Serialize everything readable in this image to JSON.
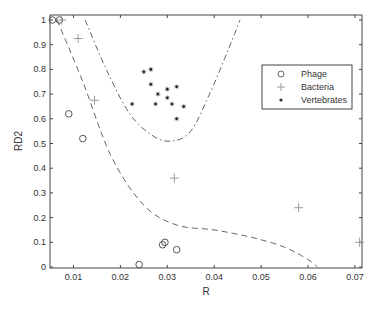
{
  "chart_data": {
    "type": "scatter",
    "title": "",
    "xlabel": "R",
    "ylabel": "RD2",
    "xlim": [
      0.005,
      0.0715
    ],
    "ylim": [
      0,
      1.0
    ],
    "xticks": [
      0.01,
      0.02,
      0.03,
      0.04,
      0.05,
      0.06,
      0.07
    ],
    "xtick_labels": [
      "0.01",
      "0.02",
      "0.03",
      "0.04",
      "0.05",
      "0.06",
      "0.07"
    ],
    "yticks": [
      0,
      0.1,
      0.2,
      0.3,
      0.4,
      0.5,
      0.6,
      0.7,
      0.8,
      0.9,
      1
    ],
    "ytick_labels": [
      "0",
      "0.1",
      "0.2",
      "0.3",
      "0.4",
      "0.5",
      "0.6",
      "0.7",
      "0.8",
      "0.9",
      "1"
    ],
    "grid": false,
    "legend_position": "upper right (inside)",
    "series": [
      {
        "name": "Phage",
        "marker": "circle",
        "points": [
          [
            0.0055,
            1.0
          ],
          [
            0.007,
            1.0
          ],
          [
            0.009,
            0.62
          ],
          [
            0.012,
            0.52
          ],
          [
            0.024,
            0.01
          ],
          [
            0.029,
            0.09
          ],
          [
            0.0295,
            0.1
          ],
          [
            0.032,
            0.07
          ]
        ]
      },
      {
        "name": "Bacteria",
        "marker": "plus",
        "points": [
          [
            0.0075,
            1.0
          ],
          [
            0.011,
            0.925
          ],
          [
            0.0145,
            0.675
          ],
          [
            0.0315,
            0.36
          ],
          [
            0.058,
            0.24
          ],
          [
            0.071,
            0.1
          ]
        ]
      },
      {
        "name": "Vertebrates",
        "marker": "star",
        "points": [
          [
            0.0225,
            0.66
          ],
          [
            0.025,
            0.79
          ],
          [
            0.0265,
            0.8
          ],
          [
            0.0265,
            0.74
          ],
          [
            0.0275,
            0.66
          ],
          [
            0.028,
            0.7
          ],
          [
            0.03,
            0.72
          ],
          [
            0.03,
            0.685
          ],
          [
            0.031,
            0.66
          ],
          [
            0.032,
            0.6
          ],
          [
            0.032,
            0.73
          ],
          [
            0.0335,
            0.65
          ]
        ]
      }
    ],
    "boundaries": [
      {
        "name": "lower-boundary",
        "style": "dashed",
        "points": [
          [
            0.0065,
            1.0
          ],
          [
            0.012,
            0.75
          ],
          [
            0.018,
            0.45
          ],
          [
            0.025,
            0.25
          ],
          [
            0.032,
            0.17
          ],
          [
            0.04,
            0.15
          ],
          [
            0.048,
            0.12
          ],
          [
            0.055,
            0.08
          ],
          [
            0.06,
            0.03
          ],
          [
            0.062,
            0.0
          ]
        ]
      },
      {
        "name": "upper-boundary",
        "style": "dash-dot",
        "points": [
          [
            0.0125,
            1.0
          ],
          [
            0.017,
            0.8
          ],
          [
            0.022,
            0.62
          ],
          [
            0.027,
            0.53
          ],
          [
            0.031,
            0.51
          ],
          [
            0.035,
            0.55
          ],
          [
            0.039,
            0.7
          ],
          [
            0.043,
            0.88
          ],
          [
            0.0455,
            1.0
          ]
        ]
      }
    ]
  },
  "legend": {
    "items": [
      {
        "label": "Phage",
        "marker": "circle"
      },
      {
        "label": "Bacteria",
        "marker": "plus"
      },
      {
        "label": "Vertebrates",
        "marker": "star"
      }
    ]
  },
  "axes": {
    "xlabel": "R",
    "ylabel": "RD2"
  }
}
